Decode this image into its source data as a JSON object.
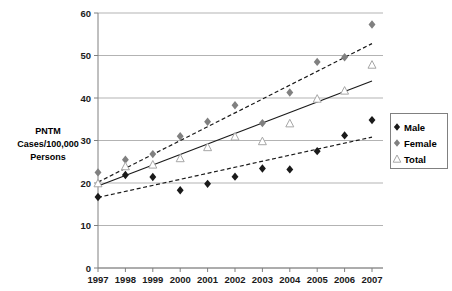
{
  "chart_data": {
    "type": "scatter",
    "title": "",
    "xlabel": "",
    "ylabel": "PNTM Cases/100,000 Persons",
    "ylabel_lines": [
      "PNTM",
      "Cases/100,000",
      "Persons"
    ],
    "x": [
      1997,
      1998,
      1999,
      2000,
      2001,
      2002,
      2003,
      2004,
      2005,
      2006,
      2007
    ],
    "categories": [
      "1997",
      "1998",
      "1999",
      "2000",
      "2001",
      "2002",
      "2003",
      "2004",
      "2005",
      "2006",
      "2007"
    ],
    "xlim": [
      1997,
      2007
    ],
    "ylim": [
      0,
      60
    ],
    "yticks": [
      0,
      10,
      20,
      30,
      40,
      50,
      60
    ],
    "ytick_labels": [
      "0",
      "10",
      "20",
      "30",
      "40",
      "50",
      "60"
    ],
    "grid": true,
    "grid_axis": "y",
    "legend_position": "right",
    "series": [
      {
        "name": "Male",
        "marker": "diamond",
        "color": "#1a1a1a",
        "values": [
          16.7,
          21.9,
          21.4,
          18.3,
          19.8,
          21.5,
          23.4,
          23.2,
          27.5,
          31.2,
          34.8
        ],
        "trendline": {
          "style": "dashed",
          "color": "#1a1a1a",
          "y_start": 16.6,
          "y_end": 30.8
        }
      },
      {
        "name": "Female",
        "marker": "diamond",
        "color": "#808080",
        "values": [
          22.5,
          25.5,
          26.8,
          31.0,
          34.4,
          38.3,
          34.1,
          41.3,
          48.5,
          49.6,
          57.3
        ],
        "trendline": {
          "style": "dashed",
          "color": "#1a1a1a",
          "y_start": 20.2,
          "y_end": 52.8
        }
      },
      {
        "name": "Total",
        "marker": "triangle-open",
        "color": "#a6a6a6",
        "values": [
          19.9,
          23.9,
          24.3,
          25.8,
          28.4,
          30.9,
          29.8,
          34.0,
          39.8,
          41.7,
          47.8
        ],
        "trendline": {
          "style": "solid",
          "color": "#1a1a1a",
          "y_start": 19.3,
          "y_end": 44.0
        }
      }
    ]
  },
  "legend": {
    "items": [
      {
        "label": "Male",
        "marker": "diamond-black"
      },
      {
        "label": "Female",
        "marker": "diamond-gray"
      },
      {
        "label": "Total",
        "marker": "triangle-open"
      }
    ]
  },
  "colors": {
    "male": "#1a1a1a",
    "female": "#808080",
    "total": "#a6a6a6",
    "grid": "#b3b3b3",
    "axis": "#808080",
    "text": "#000000",
    "background": "#ffffff",
    "legend_border": "#808080"
  }
}
